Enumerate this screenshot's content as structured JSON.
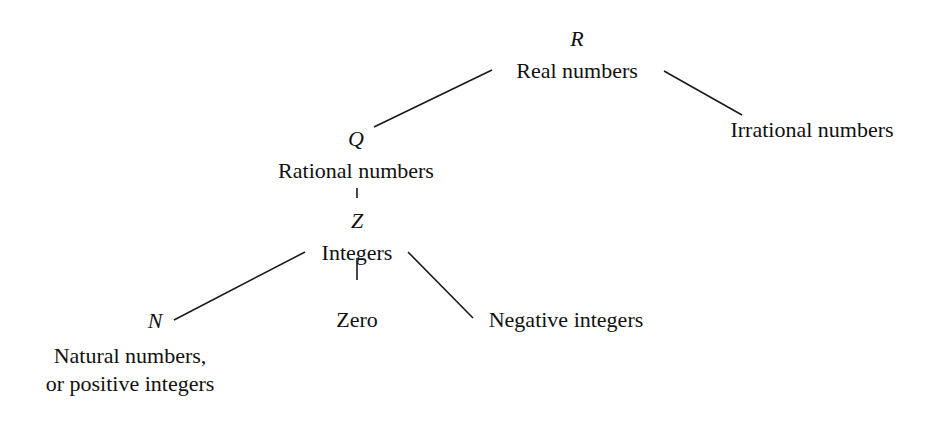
{
  "diagram": {
    "type": "tree",
    "nodes": [
      {
        "id": "real",
        "symbol": "R",
        "label": "Real numbers"
      },
      {
        "id": "irrational",
        "symbol": "",
        "label": "Irrational numbers"
      },
      {
        "id": "rational",
        "symbol": "Q",
        "label": "Rational numbers"
      },
      {
        "id": "integers",
        "symbol": "Z",
        "label": "Integers"
      },
      {
        "id": "natural",
        "symbol": "N",
        "label": "Natural numbers,",
        "label2": "or positive integers"
      },
      {
        "id": "zero",
        "symbol": "",
        "label": "Zero"
      },
      {
        "id": "negative",
        "symbol": "",
        "label": "Negative integers"
      }
    ],
    "edges": [
      [
        "real",
        "rational"
      ],
      [
        "real",
        "irrational"
      ],
      [
        "rational",
        "integers"
      ],
      [
        "integers",
        "natural"
      ],
      [
        "integers",
        "zero"
      ],
      [
        "integers",
        "negative"
      ]
    ],
    "line_color": "#1a1a1a"
  }
}
